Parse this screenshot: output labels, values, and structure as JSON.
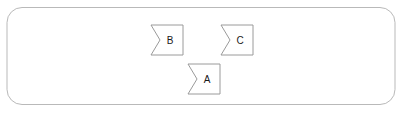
{
  "diagram": {
    "type": "flow-diagram",
    "background_color": "#ffffff",
    "container": {
      "name": "outer-container",
      "label": "",
      "x": 7,
      "y": 7.5,
      "width": 388,
      "height": 97,
      "corner_radius": 15,
      "stroke_color": "#b9b9b9",
      "fill_color": "#ffffff",
      "stroke_width": 1
    },
    "nodes": [
      {
        "id": "node-b",
        "label": "B",
        "x": 151,
        "y": 25,
        "width": 32,
        "height": 30,
        "notch_depth": 9,
        "notch_side": "left",
        "stroke_color": "#9a9a9a",
        "fill_color": "#ffffff",
        "label_color": "#1a1a1a",
        "label_x": 170,
        "label_y": 40.5
      },
      {
        "id": "node-c",
        "label": "C",
        "x": 221,
        "y": 25,
        "width": 32,
        "height": 30,
        "notch_depth": 9,
        "notch_side": "left",
        "stroke_color": "#9a9a9a",
        "fill_color": "#ffffff",
        "label_color": "#1a1a1a",
        "label_x": 240,
        "label_y": 40.5
      },
      {
        "id": "node-a",
        "label": "A",
        "x": 188,
        "y": 64,
        "width": 32,
        "height": 30,
        "notch_depth": 9,
        "notch_side": "left",
        "stroke_color": "#9a9a9a",
        "fill_color": "#ffffff",
        "label_color": "#1a1a1a",
        "label_x": 207,
        "label_y": 79.5
      }
    ]
  }
}
